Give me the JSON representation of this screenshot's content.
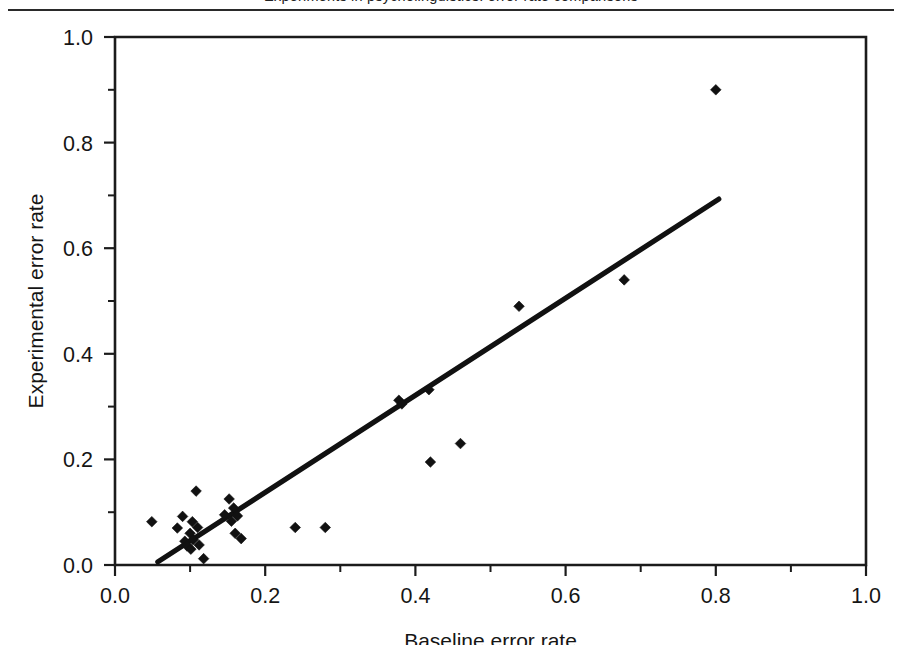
{
  "page": {
    "running_head": "Experiments in psycholinguistics: error rate comparisons",
    "background_color": "#ffffff",
    "ink_color": "#111111"
  },
  "figure": {
    "frame": {
      "left": 115,
      "right": 866,
      "top": 23,
      "bottom": 551
    }
  },
  "chart_data": {
    "type": "scatter",
    "title": "",
    "xlabel": "Baseline error rate",
    "ylabel": "Experimental error rate",
    "xlim": [
      0.0,
      1.0
    ],
    "ylim": [
      0.0,
      1.0
    ],
    "xticks": [
      0.0,
      0.2,
      0.4,
      0.6,
      0.8,
      1.0
    ],
    "yticks": [
      0.0,
      0.2,
      0.4,
      0.6,
      0.8,
      1.0
    ],
    "xtick_labels": [
      "0.0",
      "0.2",
      "0.4",
      "0.6",
      "0.8",
      "1.0"
    ],
    "ytick_labels": [
      "0.0",
      "0.2",
      "0.4",
      "0.6",
      "0.8",
      "1.0"
    ],
    "minor_ticks_x": [
      0.1,
      0.3,
      0.5,
      0.7,
      0.9
    ],
    "minor_ticks_y": [
      0.1,
      0.3,
      0.5,
      0.7,
      0.9
    ],
    "grid": false,
    "legend": null,
    "marker": "diamond",
    "marker_color": "#111111",
    "series": [
      {
        "name": "Error rate pairs",
        "points": [
          [
            0.049,
            0.082
          ],
          [
            0.083,
            0.07
          ],
          [
            0.09,
            0.092
          ],
          [
            0.093,
            0.045
          ],
          [
            0.096,
            0.036
          ],
          [
            0.1,
            0.06
          ],
          [
            0.101,
            0.03
          ],
          [
            0.103,
            0.082
          ],
          [
            0.104,
            0.048
          ],
          [
            0.108,
            0.14
          ],
          [
            0.11,
            0.071
          ],
          [
            0.112,
            0.038
          ],
          [
            0.118,
            0.012
          ],
          [
            0.146,
            0.095
          ],
          [
            0.152,
            0.125
          ],
          [
            0.155,
            0.083
          ],
          [
            0.158,
            0.108
          ],
          [
            0.16,
            0.06
          ],
          [
            0.163,
            0.093
          ],
          [
            0.168,
            0.05
          ],
          [
            0.24,
            0.071
          ],
          [
            0.28,
            0.071
          ],
          [
            0.378,
            0.312
          ],
          [
            0.382,
            0.305
          ],
          [
            0.418,
            0.332
          ],
          [
            0.42,
            0.195
          ],
          [
            0.46,
            0.23
          ],
          [
            0.538,
            0.49
          ],
          [
            0.678,
            0.54
          ],
          [
            0.8,
            0.9
          ]
        ]
      }
    ],
    "trendline": {
      "name": "fitted regression line",
      "x_start": 0.057,
      "y_start": 0.006,
      "x_end": 0.804,
      "y_end": 0.693,
      "color": "#111111"
    }
  }
}
